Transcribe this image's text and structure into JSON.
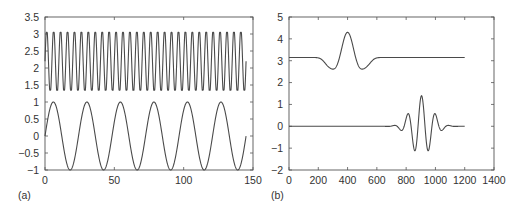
{
  "chart_data": [
    {
      "panel": "(a)",
      "type": "line",
      "title": "",
      "xlabel": "",
      "ylabel": "",
      "xlim": [
        0,
        150
      ],
      "ylim": [
        -1,
        3.5
      ],
      "xticks": [
        0,
        50,
        100,
        150
      ],
      "yticks": [
        -1,
        -0.5,
        0,
        0.5,
        1,
        1.5,
        2,
        2.5,
        3,
        3.5
      ],
      "ytick_labels": [
        "−1",
        "−0.5",
        "0",
        "0.5",
        "1",
        "1.5",
        "2",
        "2.5",
        "3",
        "3.5"
      ],
      "grid": false,
      "legend": null,
      "series": [
        {
          "name": "clipped high-frequency oscillation",
          "description": "offset sinusoid, period ~5, clipped between ~1.35 and ~3.05",
          "x_range": [
            0,
            145
          ],
          "period": 5,
          "offset": 2.2,
          "amplitude": 0.95,
          "clip": [
            1.35,
            3.05
          ],
          "approx_peaks": 29
        },
        {
          "name": "low-frequency sine",
          "description": "sin wave, 6 full cycles from 0 to 145, amplitude 1",
          "x_range": [
            0,
            145
          ],
          "period": 24.17,
          "offset": 0,
          "amplitude": 1,
          "peaks_x": [
            6,
            30,
            54,
            79,
            103,
            127
          ],
          "troughs_x": [
            18,
            42,
            66,
            91,
            115,
            139
          ]
        }
      ]
    },
    {
      "panel": "(b)",
      "type": "line",
      "title": "",
      "xlabel": "",
      "ylabel": "",
      "xlim": [
        0,
        1400
      ],
      "ylim": [
        -2,
        5
      ],
      "xticks": [
        0,
        200,
        400,
        600,
        800,
        1000,
        1200,
        1400
      ],
      "yticks": [
        -2,
        -1,
        0,
        1,
        2,
        3,
        4,
        5
      ],
      "ytick_labels": [
        "−2",
        "−1",
        "0",
        "1",
        "2",
        "3",
        "4",
        "5"
      ],
      "grid": false,
      "legend": null,
      "series": [
        {
          "name": "upper wavelet",
          "description": "Mexican-hat-like wavelet on baseline 3.15",
          "x_range": [
            0,
            1200
          ],
          "baseline": 3.15,
          "center": 400,
          "peak": 4.3,
          "troughs": [
            [
              335,
              2.55
            ],
            [
              470,
              2.55
            ]
          ],
          "side_bumps": [
            [
              260,
              3.3
            ],
            [
              540,
              3.3
            ]
          ],
          "kind": "ricker",
          "sigma": 55,
          "amplitude": 1.15
        },
        {
          "name": "lower wavelet",
          "description": "Morlet-like wave packet on baseline 0",
          "x_range": [
            0,
            1200
          ],
          "baseline": 0,
          "center": 905,
          "peak": 1.4,
          "troughs": [
            [
              855,
              -1.1
            ],
            [
              952,
              -1.1
            ]
          ],
          "side_peaks": [
            [
              810,
              0.55
            ],
            [
              1000,
              0.55
            ]
          ],
          "kind": "morlet",
          "period": 95,
          "sigma": 70,
          "amplitude": 1.4
        }
      ]
    }
  ],
  "labels": {
    "panel_a": "(a)",
    "panel_b": "(b)"
  }
}
